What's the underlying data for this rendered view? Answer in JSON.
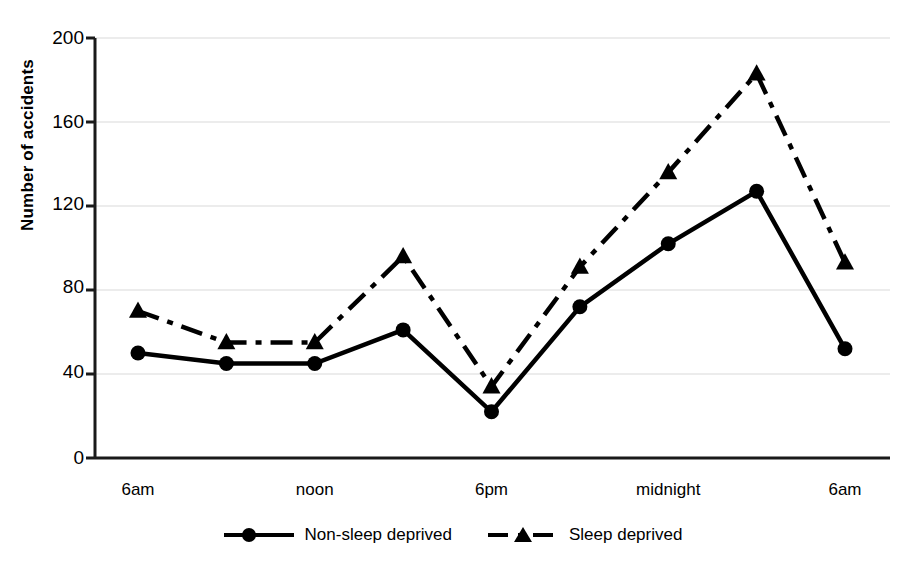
{
  "chart_data": {
    "type": "line",
    "title": "",
    "xlabel": "",
    "ylabel": "Number of accidents",
    "ylim": [
      0,
      200
    ],
    "yticks": [
      0,
      40,
      80,
      120,
      160,
      200
    ],
    "grid": true,
    "grid_axis": "y",
    "legend_position": "bottom-center",
    "x": [
      0,
      1,
      2,
      3,
      4,
      5,
      6,
      7,
      8
    ],
    "xticks": [
      0,
      2,
      4,
      6,
      8
    ],
    "xticklabels": [
      "6am",
      "noon",
      "6pm",
      "midnight",
      "6am"
    ],
    "categories": [
      "6am",
      "9am",
      "noon",
      "3pm",
      "6pm",
      "9pm",
      "midnight",
      "3am",
      "6am"
    ],
    "series": [
      {
        "name": "Non-sleep deprived",
        "marker": "circle",
        "linestyle": "solid",
        "color": "#000000",
        "values": [
          50,
          45,
          45,
          61,
          22,
          72,
          102,
          127,
          52
        ]
      },
      {
        "name": "Sleep deprived",
        "marker": "triangle",
        "linestyle": "dash-dot",
        "color": "#000000",
        "values": [
          70,
          55,
          55,
          96,
          34,
          91,
          136,
          183,
          93
        ]
      }
    ]
  },
  "axes": {
    "y_tick_labels": [
      "200",
      "160",
      "120",
      "80",
      "40",
      "0"
    ],
    "y_axis_title": "Number of accidents",
    "x_tick_labels": [
      "6am",
      "noon",
      "6pm",
      "midnight",
      "6am"
    ]
  },
  "legend": {
    "entries": [
      {
        "label": "Non-sleep deprived",
        "marker": "circle-marker",
        "line": "solid-line"
      },
      {
        "label": "Sleep deprived",
        "marker": "triangle-marker",
        "line": "dashed-line"
      }
    ]
  },
  "colors": {
    "ink": "#000000",
    "gridline": "#d9d9d9",
    "background": "#ffffff"
  }
}
